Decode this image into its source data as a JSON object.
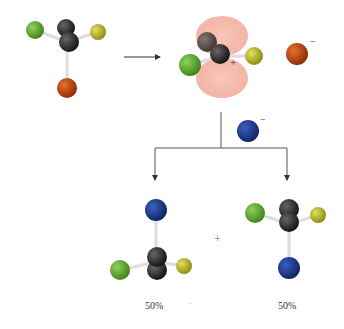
{
  "diagram": {
    "type": "reaction-mechanism",
    "colors": {
      "green": "#5aa82a",
      "yellow": "#b0b020",
      "orange": "#c24a10",
      "blue": "#1e3a8c",
      "black": "#2a2a2a",
      "lobe": "#f2b0a0",
      "arrow": "#333333"
    },
    "charges": {
      "carbocation": "+",
      "leaving_group": "−",
      "nucleophile": "−",
      "plus_sign": "+"
    },
    "products": [
      {
        "label": "50%"
      },
      {
        "label": "50%"
      }
    ],
    "dot": "·"
  }
}
